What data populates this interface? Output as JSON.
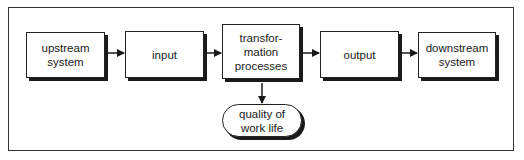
{
  "diagram": {
    "nodes": [
      {
        "id": "upstream",
        "label": "upstream\nsystem"
      },
      {
        "id": "input",
        "label": "input"
      },
      {
        "id": "transformation",
        "label": "transfor-\nmation\nprocesses"
      },
      {
        "id": "output",
        "label": "output"
      },
      {
        "id": "downstream",
        "label": "downstream\nsystem"
      },
      {
        "id": "quality",
        "label": "quality of\nwork life"
      }
    ],
    "edges": [
      {
        "from": "upstream",
        "to": "input"
      },
      {
        "from": "input",
        "to": "transformation"
      },
      {
        "from": "transformation",
        "to": "output"
      },
      {
        "from": "output",
        "to": "downstream"
      },
      {
        "from": "transformation",
        "to": "quality"
      }
    ]
  }
}
